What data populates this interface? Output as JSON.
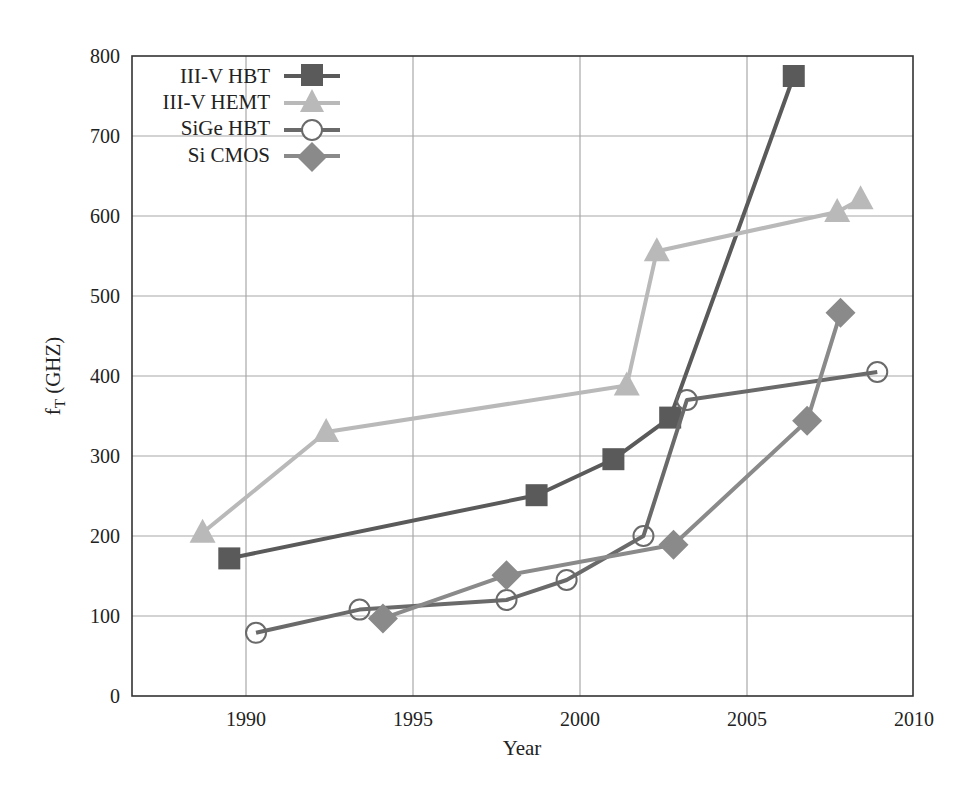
{
  "chart_data": {
    "type": "line",
    "title": "",
    "xlabel": "Year",
    "ylabel": "f_T (GHZ)",
    "ylabel_main": "f",
    "ylabel_sub": "T",
    "ylabel_unit": " (GHZ)",
    "xlim": [
      1986.6,
      2010
    ],
    "ylim": [
      0,
      800
    ],
    "xticks": [
      1990,
      1995,
      2000,
      2005,
      2010
    ],
    "yticks": [
      0,
      100,
      200,
      300,
      400,
      500,
      600,
      700,
      800
    ],
    "grid": true,
    "legend_position": "upper-left",
    "series": [
      {
        "name": "III-V HBT",
        "marker": "square",
        "color": "#5a5a5a",
        "x": [
          1989.5,
          1998.7,
          2001.0,
          2002.7,
          2006.4
        ],
        "y": [
          172,
          251,
          296,
          348,
          775
        ]
      },
      {
        "name": "III-V HEMT",
        "marker": "triangle",
        "color": "#b9b9b9",
        "x": [
          1988.7,
          1992.4,
          2001.4,
          2002.3,
          2007.7,
          2008.4
        ],
        "y": [
          204,
          330,
          388,
          556,
          605,
          621
        ]
      },
      {
        "name": "SiGe HBT",
        "marker": "circle",
        "color": "#6a6a6a",
        "x": [
          1990.3,
          1993.4,
          1997.8,
          1999.6,
          2001.9,
          2003.2,
          2008.9
        ],
        "y": [
          79,
          108,
          120,
          145,
          200,
          370,
          405
        ]
      },
      {
        "name": "Si CMOS",
        "marker": "diamond",
        "color": "#8a8a8a",
        "x": [
          1994.1,
          1997.8,
          2002.8,
          2006.8,
          2007.8
        ],
        "y": [
          97,
          151,
          189,
          344,
          479
        ]
      }
    ]
  },
  "legend": {
    "items": [
      {
        "label": "III-V HBT"
      },
      {
        "label": "III-V HEMT"
      },
      {
        "label": "SiGe HBT"
      },
      {
        "label": "Si CMOS"
      }
    ]
  },
  "axes": {
    "x_title": "Year",
    "x_ticks": [
      "1990",
      "1995",
      "2000",
      "2005",
      "2010"
    ],
    "y_ticks": [
      "0",
      "100",
      "200",
      "300",
      "400",
      "500",
      "600",
      "700",
      "800"
    ],
    "y_title_main": "f",
    "y_title_sub": "T",
    "y_title_unit": " (GHZ)"
  }
}
